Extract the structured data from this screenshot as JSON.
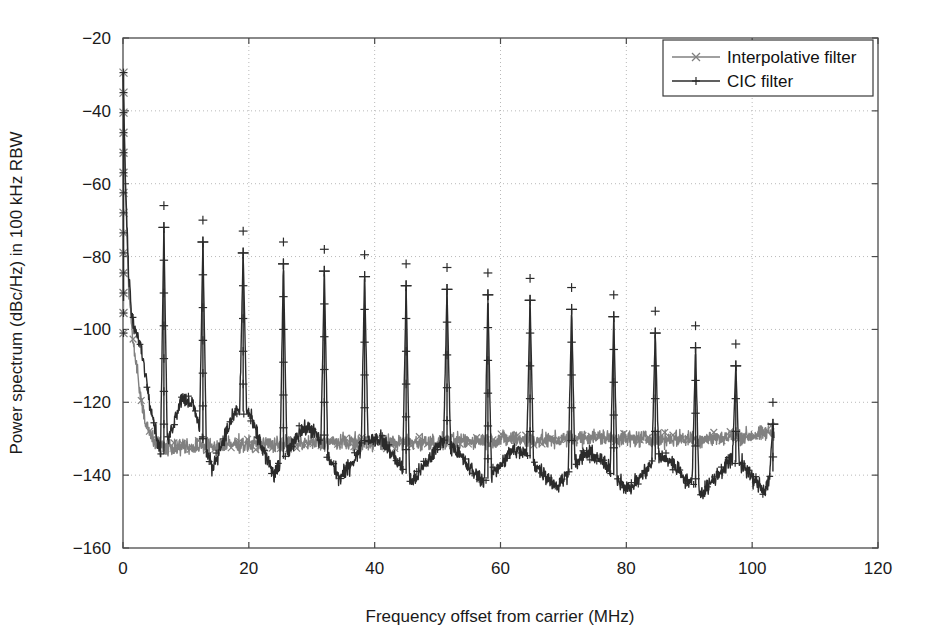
{
  "chart_data": {
    "type": "line",
    "title": "",
    "xlabel": "Frequency offset from carrier (MHz)",
    "ylabel": "Power spectrum (dBc/Hz) in 100 kHz RBW",
    "xlim": [
      0,
      120
    ],
    "ylim": [
      -160,
      -20
    ],
    "xticks": [
      0,
      20,
      40,
      60,
      80,
      100,
      120
    ],
    "yticks": [
      -20,
      -40,
      -60,
      -80,
      -100,
      -120,
      -140,
      -160
    ],
    "xtick_labels": [
      "0",
      "20",
      "40",
      "60",
      "80",
      "100",
      "120"
    ],
    "ytick_labels": [
      "−20",
      "−40",
      "−60",
      "−80",
      "−100",
      "−120",
      "−140",
      "−160"
    ],
    "grid": true,
    "grid_style": "dotted",
    "legend_position": "top-right",
    "data_x_extent": [
      0,
      103.5
    ],
    "series": [
      {
        "name": "Interpolative filter",
        "marker": "x",
        "color": "#808080",
        "linewidth": 1.4,
        "carrier_peak_dbc": -29.5,
        "noise_floor_dbc": -131,
        "description": "Gray trace: carrier at 0 MHz drops steeply to a flat noise floor near -131 dBc/Hz with small ripple, no image spurs.",
        "floor_profile": [
          {
            "f": 0.0,
            "y": -29.5
          },
          {
            "f": 0.4,
            "y": -62
          },
          {
            "f": 0.9,
            "y": -88
          },
          {
            "f": 1.4,
            "y": -100
          },
          {
            "f": 2.0,
            "y": -108
          },
          {
            "f": 2.8,
            "y": -118
          },
          {
            "f": 3.6,
            "y": -125
          },
          {
            "f": 4.6,
            "y": -130
          },
          {
            "f": 6.0,
            "y": -132
          },
          {
            "f": 9.0,
            "y": -132.5
          },
          {
            "f": 13.0,
            "y": -132
          },
          {
            "f": 18.0,
            "y": -131.5
          },
          {
            "f": 24.0,
            "y": -131.5
          },
          {
            "f": 32.0,
            "y": -131
          },
          {
            "f": 40.0,
            "y": -131
          },
          {
            "f": 48.0,
            "y": -131
          },
          {
            "f": 56.0,
            "y": -130.5
          },
          {
            "f": 62.0,
            "y": -130
          },
          {
            "f": 68.0,
            "y": -130.5
          },
          {
            "f": 74.0,
            "y": -129.5
          },
          {
            "f": 80.0,
            "y": -130
          },
          {
            "f": 86.0,
            "y": -130
          },
          {
            "f": 92.0,
            "y": -130
          },
          {
            "f": 97.0,
            "y": -129.5
          },
          {
            "f": 101.0,
            "y": -129
          },
          {
            "f": 103.5,
            "y": -128
          }
        ]
      },
      {
        "name": "CIC filter",
        "marker": "+",
        "color": "#2b2b2b",
        "linewidth": 1.4,
        "carrier_peak_dbc": -29.5,
        "noise_floor_dbc": -138,
        "description": "Dark trace: carrier at 0 MHz plus periodic image spurs every ~6.5 MHz whose peaks decay from -72 dBc/Hz to -112 dBc/Hz; between spurs the floor ripples between about -131 and -143 dBc/Hz.",
        "spur_spacing_mhz": 6.5,
        "spurs": [
          {
            "f": 6.5,
            "peak": -72.0
          },
          {
            "f": 12.7,
            "peak": -76.0
          },
          {
            "f": 19.1,
            "peak": -79.0
          },
          {
            "f": 25.5,
            "peak": -82.0
          },
          {
            "f": 32.0,
            "peak": -84.0
          },
          {
            "f": 38.4,
            "peak": -85.5
          },
          {
            "f": 45.0,
            "peak": -88.0
          },
          {
            "f": 51.5,
            "peak": -89.0
          },
          {
            "f": 58.0,
            "peak": -90.5
          },
          {
            "f": 64.7,
            "peak": -92.0
          },
          {
            "f": 71.3,
            "peak": -94.5
          },
          {
            "f": 78.0,
            "peak": -96.5
          },
          {
            "f": 84.6,
            "peak": -101.0
          },
          {
            "f": 91.0,
            "peak": -105.0
          },
          {
            "f": 97.4,
            "peak": -110.0
          },
          {
            "f": 103.3,
            "peak": -126.0
          }
        ],
        "floor_profile": [
          {
            "f": 0.0,
            "y": -29.5
          },
          {
            "f": 0.4,
            "y": -60
          },
          {
            "f": 0.9,
            "y": -85
          },
          {
            "f": 1.4,
            "y": -97
          },
          {
            "f": 2.0,
            "y": -101
          },
          {
            "f": 2.6,
            "y": -103
          },
          {
            "f": 3.4,
            "y": -110
          },
          {
            "f": 4.2,
            "y": -119
          },
          {
            "f": 5.2,
            "y": -128
          },
          {
            "f": 6.2,
            "y": -136
          },
          {
            "f": 7.6,
            "y": -128
          },
          {
            "f": 9.2,
            "y": -119
          },
          {
            "f": 11.0,
            "y": -120
          },
          {
            "f": 12.6,
            "y": -130
          },
          {
            "f": 14.2,
            "y": -138
          },
          {
            "f": 16.0,
            "y": -130
          },
          {
            "f": 18.0,
            "y": -122
          },
          {
            "f": 20.0,
            "y": -123
          },
          {
            "f": 22.0,
            "y": -132
          },
          {
            "f": 24.0,
            "y": -140
          },
          {
            "f": 26.0,
            "y": -134
          },
          {
            "f": 28.0,
            "y": -128
          },
          {
            "f": 30.0,
            "y": -127
          },
          {
            "f": 32.0,
            "y": -133
          },
          {
            "f": 34.5,
            "y": -141
          },
          {
            "f": 37.0,
            "y": -135
          },
          {
            "f": 39.0,
            "y": -130
          },
          {
            "f": 41.0,
            "y": -130
          },
          {
            "f": 43.5,
            "y": -136
          },
          {
            "f": 46.0,
            "y": -142
          },
          {
            "f": 48.5,
            "y": -136
          },
          {
            "f": 50.5,
            "y": -131
          },
          {
            "f": 52.5,
            "y": -132
          },
          {
            "f": 55.0,
            "y": -138
          },
          {
            "f": 57.5,
            "y": -142
          },
          {
            "f": 60.0,
            "y": -137
          },
          {
            "f": 62.0,
            "y": -133
          },
          {
            "f": 64.0,
            "y": -134
          },
          {
            "f": 66.5,
            "y": -139
          },
          {
            "f": 69.0,
            "y": -143
          },
          {
            "f": 71.5,
            "y": -138
          },
          {
            "f": 73.5,
            "y": -134
          },
          {
            "f": 75.5,
            "y": -135
          },
          {
            "f": 78.0,
            "y": -140
          },
          {
            "f": 80.5,
            "y": -144
          },
          {
            "f": 83.0,
            "y": -139
          },
          {
            "f": 85.0,
            "y": -135
          },
          {
            "f": 87.0,
            "y": -136
          },
          {
            "f": 89.5,
            "y": -141
          },
          {
            "f": 92.0,
            "y": -145
          },
          {
            "f": 94.5,
            "y": -140
          },
          {
            "f": 96.5,
            "y": -136
          },
          {
            "f": 98.5,
            "y": -137
          },
          {
            "f": 100.5,
            "y": -142
          },
          {
            "f": 102.0,
            "y": -144
          },
          {
            "f": 103.3,
            "y": -139
          }
        ]
      }
    ],
    "noise_amplitude_db": 2.2
  },
  "legend": {
    "entries": [
      {
        "label": "Interpolative filter",
        "marker": "x",
        "color": "#808080"
      },
      {
        "label": "CIC filter",
        "marker": "+",
        "color": "#2b2b2b"
      }
    ]
  },
  "axes": {
    "x_title": "Frequency offset from carrier (MHz)",
    "y_title": "Power spectrum (dBc/Hz) in 100 kHz RBW"
  }
}
